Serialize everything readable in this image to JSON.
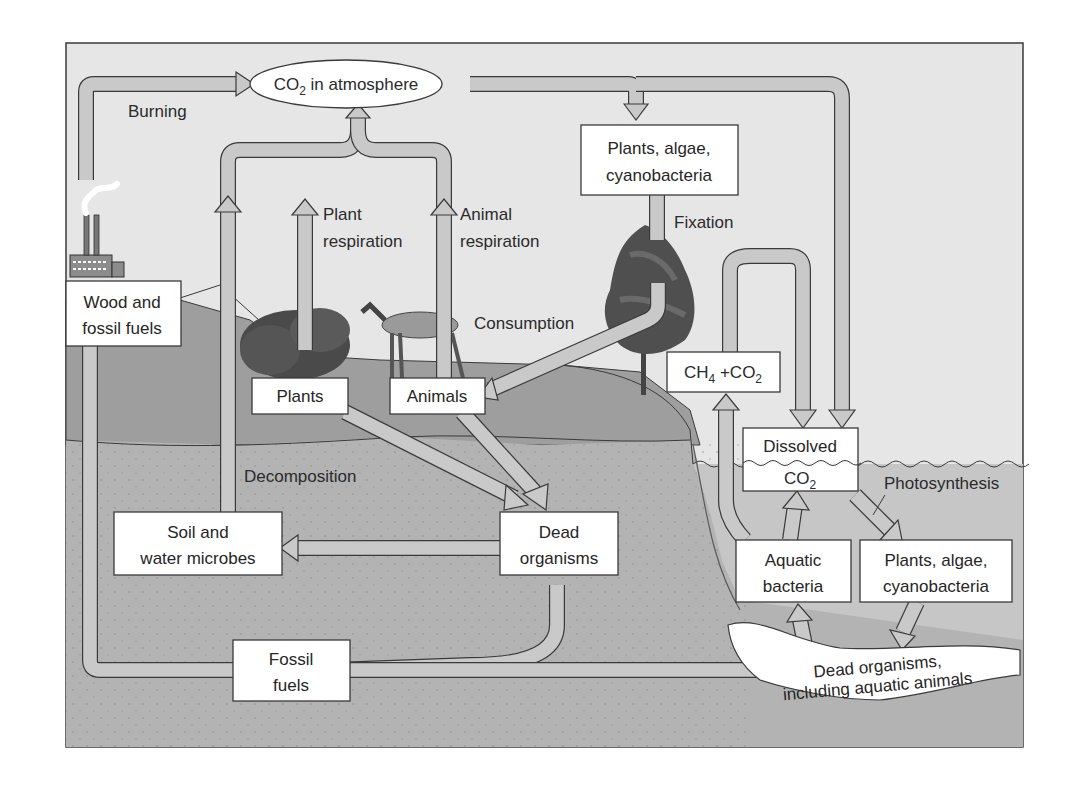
{
  "figure": {
    "colors": {
      "sky": "#e6e6e6",
      "land": "#a8a8a8",
      "soil": "#b4b4b4",
      "water": "#c8c8c8",
      "arrow_fill": "#c9c9c9",
      "outline": "#3a3a3a",
      "box_fill": "#ffffff"
    }
  },
  "nodes": {
    "co2_atmosphere": {
      "prefix": "CO",
      "sub": "2",
      "suffix": " in atmosphere"
    },
    "plants_algae_top": {
      "line1": "Plants, algae,",
      "line2": "cyanobacteria"
    },
    "wood_fossil": {
      "line1": "Wood and",
      "line2": "fossil fuels"
    },
    "plants": {
      "label": "Plants"
    },
    "animals": {
      "label": "Animals"
    },
    "ch4_co2": {
      "a": "CH",
      "a_sub": "4",
      "mid": " +CO",
      "b_sub": "2"
    },
    "dissolved_co2": {
      "line1": "Dissolved",
      "line2_prefix": "CO",
      "line2_sub": "2"
    },
    "soil_microbes": {
      "line1": "Soil and",
      "line2": "water microbes"
    },
    "dead_organisms": {
      "line1": "Dead",
      "line2": "organisms"
    },
    "aquatic_bacteria": {
      "line1": "Aquatic",
      "line2": "bacteria"
    },
    "plants_algae_water": {
      "line1": "Plants, algae,",
      "line2": "cyanobacteria"
    },
    "fossil_fuels": {
      "line1": "Fossil",
      "line2": "fuels"
    },
    "dead_aquatic": {
      "line1": "Dead organisms,",
      "line2": "including aquatic animals"
    }
  },
  "process_labels": {
    "burning": "Burning",
    "plant_respiration": {
      "line1": "Plant",
      "line2": "respiration"
    },
    "animal_respiration": {
      "line1": "Animal",
      "line2": "respiration"
    },
    "fixation": "Fixation",
    "consumption": "Consumption",
    "decomposition": "Decomposition",
    "photosynthesis": "Photosynthesis"
  },
  "illustrations": [
    "factory-icon",
    "shrub-icon",
    "deer-icon",
    "tree-icon"
  ]
}
